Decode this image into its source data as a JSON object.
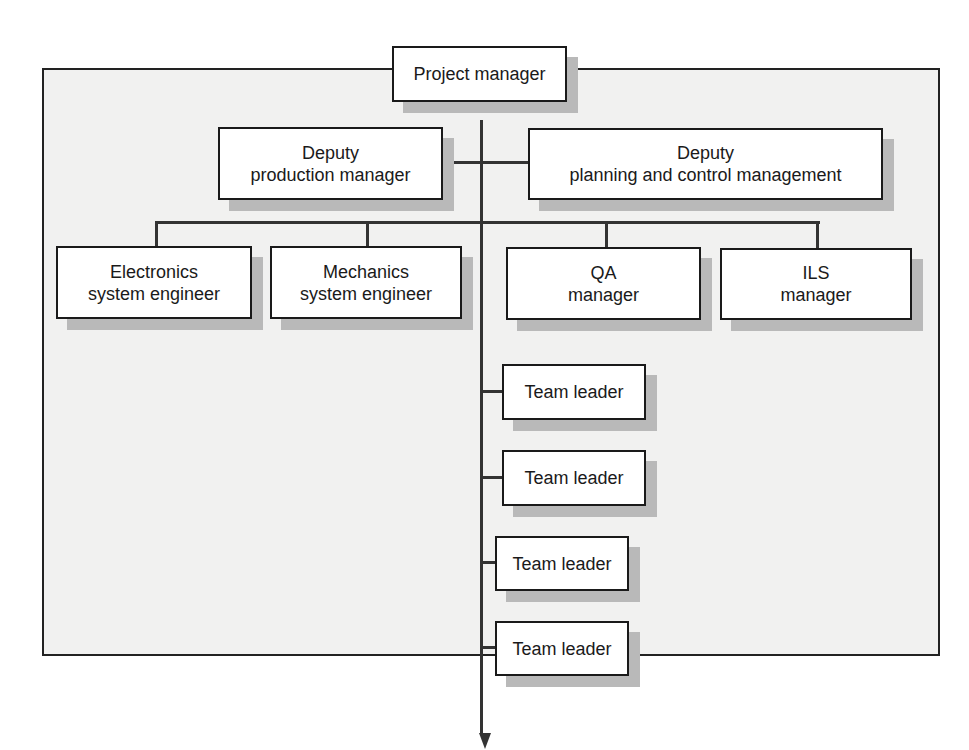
{
  "diagram": {
    "type": "organization-chart",
    "root": {
      "label": "Project manager"
    },
    "deputies": [
      {
        "line1": "Deputy",
        "line2": "production manager"
      },
      {
        "line1": "Deputy",
        "line2": "planning and control management"
      }
    ],
    "managers": [
      {
        "line1": "Electronics",
        "line2": "system engineer"
      },
      {
        "line1": "Mechanics",
        "line2": "system engineer"
      },
      {
        "line1": "QA",
        "line2": "manager"
      },
      {
        "line1": "ILS",
        "line2": "manager"
      }
    ],
    "team_leaders": [
      {
        "label": "Team leader"
      },
      {
        "label": "Team leader"
      },
      {
        "label": "Team leader"
      },
      {
        "label": "Team leader"
      }
    ],
    "continuation": "arrow-down",
    "colors": {
      "panel_bg": "#f1f1f0",
      "box_bg": "#ffffff",
      "border": "#1a1a1a",
      "shadow": "#b9b9b9",
      "connector": "#333333"
    }
  }
}
